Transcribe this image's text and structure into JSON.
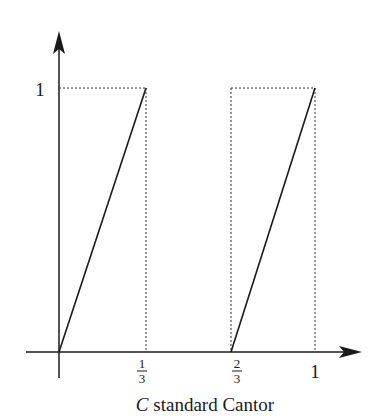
{
  "diagram": {
    "type": "piecewise-linear function plot",
    "caption": {
      "symbol": "C",
      "text": "standard Cantor"
    },
    "axes": {
      "x_ticks": [
        {
          "value": 0.3333,
          "num": "1",
          "den": "3"
        },
        {
          "value": 0.6667,
          "num": "2",
          "den": "3"
        },
        {
          "value": 1,
          "label": "1"
        }
      ],
      "y_ticks": [
        {
          "value": 1,
          "label": "1"
        }
      ]
    },
    "segments": [
      {
        "from": [
          0,
          0
        ],
        "to": [
          0.3333,
          1
        ],
        "style": "solid"
      },
      {
        "from": [
          0.6667,
          0
        ],
        "to": [
          1,
          1
        ],
        "style": "solid"
      }
    ],
    "guides": [
      {
        "rect": [
          0,
          0,
          0.3333,
          1
        ],
        "style": "dotted"
      },
      {
        "rect": [
          0.6667,
          0,
          1,
          1
        ],
        "style": "dotted"
      }
    ],
    "colors": {
      "ink": "#1a1a1a",
      "background": "#ffffff"
    }
  }
}
